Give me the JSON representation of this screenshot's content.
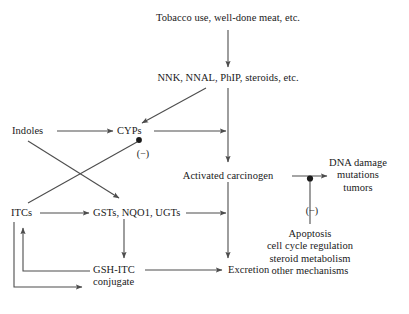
{
  "figure": {
    "type": "flow-diagram",
    "background_color": "#ffffff",
    "line_color": "#4d4d4d",
    "text_color": "#1a1a1a"
  },
  "nodes": {
    "tobacco": {
      "label": "Tobacco use, well-done meat, etc.",
      "x": 228,
      "y": 18,
      "align": "center"
    },
    "nnk": {
      "label": "NNK, NNAL, PhIP, steroids, etc.",
      "x": 228,
      "y": 78,
      "align": "center"
    },
    "indoles": {
      "label": "Indoles",
      "x": 12,
      "y": 128,
      "align": "left"
    },
    "cyps": {
      "label": "CYPs",
      "x": 120,
      "y": 128,
      "align": "left"
    },
    "itcs": {
      "label": "ITCs",
      "x": 12,
      "y": 210,
      "align": "left"
    },
    "gsts": {
      "label": "GSTs, NQO1, UGTs",
      "x": 96,
      "y": 210,
      "align": "left"
    },
    "gsh_itc": {
      "label": "GSH-ITC\nconjugate",
      "x": 94,
      "y": 266,
      "align": "left"
    },
    "activated_carcinogen": {
      "label": "Activated carcinogen",
      "x": 228,
      "y": 171,
      "align": "center"
    },
    "dna_damage": {
      "label": "DNA damage\nmutations\ntumors",
      "x": 357,
      "y": 163,
      "align": "center"
    },
    "apoptosis": {
      "label": "Apoptosis\ncell cycle regulation\nsteroid metabolism\nother mechanisms",
      "x": 310,
      "y": 232,
      "align": "center"
    },
    "excretion": {
      "label": "Excretion",
      "x": 228,
      "y": 266,
      "align": "left"
    }
  },
  "inhibition_labels": [
    {
      "name": "cyp-inhibition-label",
      "text": "(−)",
      "x": 143,
      "y": 148
    },
    {
      "name": "dna-damage-inhibition-label",
      "text": "(−)",
      "x": 312,
      "y": 205
    }
  ],
  "edges": [
    {
      "name": "tobacco-to-nnk",
      "kind": "arrow",
      "from": "tobacco",
      "to": "nnk"
    },
    {
      "name": "nnk-to-activated-carcinogen",
      "kind": "arrow",
      "from": "nnk",
      "to": "activated_carcinogen"
    },
    {
      "name": "nnk-to-cyps",
      "kind": "arrow",
      "from": "nnk",
      "to": "cyps"
    },
    {
      "name": "indoles-to-cyps",
      "kind": "arrow",
      "from": "indoles",
      "to": "cyps"
    },
    {
      "name": "indoles-to-gsts",
      "kind": "arrow",
      "from": "indoles",
      "to": "gsts"
    },
    {
      "name": "itcs-to-cyps-inhibition",
      "kind": "inhibition",
      "from": "itcs",
      "to": "cyps"
    },
    {
      "name": "itcs-to-gsts",
      "kind": "arrow",
      "from": "itcs",
      "to": "gsts"
    },
    {
      "name": "cyps-to-main-axis",
      "kind": "arrow",
      "from": "cyps",
      "to": "activated_carcinogen"
    },
    {
      "name": "gsts-to-main-axis",
      "kind": "arrow",
      "from": "gsts",
      "to": "excretion"
    },
    {
      "name": "gsts-to-gsh-itc",
      "kind": "arrow",
      "from": "gsts",
      "to": "gsh_itc"
    },
    {
      "name": "gsh-itc-to-excretion",
      "kind": "arrow",
      "from": "gsh_itc",
      "to": "excretion"
    },
    {
      "name": "gsh-itc-to-itcs-feedback",
      "kind": "arrow",
      "from": "gsh_itc",
      "to": "itcs"
    },
    {
      "name": "itcs-to-gsh-itc-feedback",
      "kind": "arrow",
      "from": "itcs",
      "to": "gsh_itc"
    },
    {
      "name": "activated-carcinogen-to-excretion",
      "kind": "arrow",
      "from": "activated_carcinogen",
      "to": "excretion"
    },
    {
      "name": "activated-carcinogen-to-dna-damage",
      "kind": "arrow",
      "from": "activated_carcinogen",
      "to": "dna_damage"
    },
    {
      "name": "apoptosis-inhibits-dna-damage",
      "kind": "inhibition",
      "from": "apoptosis",
      "to": "dna_damage"
    }
  ]
}
